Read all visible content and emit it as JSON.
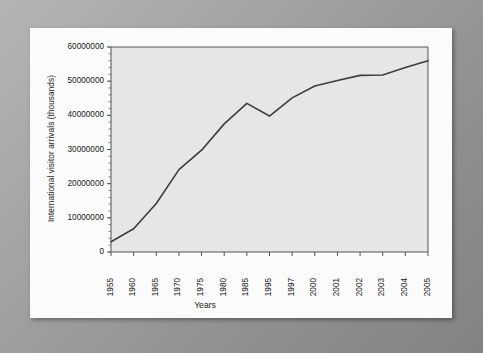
{
  "chart_data": {
    "type": "line",
    "title": "",
    "xlabel": "Years",
    "ylabel": "International visitor arrivals (thousands)",
    "categories": [
      "1955",
      "1960",
      "1965",
      "1970",
      "1975",
      "1980",
      "1985",
      "1995",
      "1997",
      "2000",
      "2001",
      "2002",
      "2003",
      "2004",
      "2005"
    ],
    "values": [
      3000000,
      6800000,
      14200000,
      24100000,
      29800000,
      37500000,
      43500000,
      39800000,
      45100000,
      48600000,
      50200000,
      51700000,
      51800000,
      54000000,
      56000000
    ],
    "series": [
      {
        "name": "International visitor arrivals",
        "values": [
          3000000,
          6800000,
          14200000,
          24100000,
          29800000,
          37500000,
          43500000,
          39800000,
          45100000,
          48600000,
          50200000,
          51700000,
          51800000,
          54000000,
          56000000
        ]
      }
    ],
    "ylim": [
      0,
      60000000
    ],
    "ytick_labels": [
      "0",
      "10000000",
      "20000000",
      "30000000",
      "40000000",
      "50000000",
      "60000000"
    ],
    "ytick_values": [
      0,
      10000000,
      20000000,
      30000000,
      40000000,
      50000000,
      60000000
    ],
    "grid": false,
    "legend": "none",
    "line_color": "#3d3d3d",
    "plot_background": "#e6e6e6",
    "panel_background": "#fbfbfb",
    "axis_color": "#555555"
  }
}
